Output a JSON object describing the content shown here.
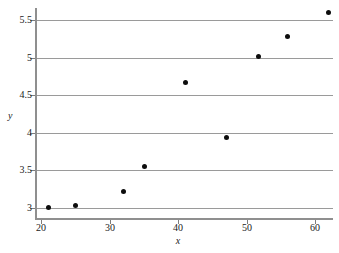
{
  "chart_data": {
    "type": "scatter",
    "title": "",
    "xlabel": "x",
    "ylabel": "y",
    "xlim": [
      19.2,
      62.6
    ],
    "ylim": [
      2.86,
      5.66
    ],
    "grid": true,
    "grid_axis": "y",
    "legend": null,
    "marker": {
      "shape": "circle",
      "color": "#0d0d0d",
      "size": 5
    },
    "xticks": [
      20,
      30,
      40,
      50,
      60
    ],
    "xtick_labels": [
      "20",
      "30",
      "40",
      "50",
      "60"
    ],
    "yticks": [
      3,
      3.5,
      4,
      4.5,
      5,
      5.5
    ],
    "ytick_labels": [
      "3",
      "3.5",
      "4",
      "4.5",
      "5",
      "5.5"
    ],
    "x": [
      21,
      25,
      32,
      35,
      41,
      47,
      51.7,
      56,
      62
    ],
    "y": [
      3.0,
      3.03,
      3.22,
      3.55,
      4.67,
      3.93,
      5.02,
      5.28,
      5.6
    ],
    "points": [
      {
        "x": 21,
        "y": 3.0
      },
      {
        "x": 25,
        "y": 3.03
      },
      {
        "x": 32,
        "y": 3.22
      },
      {
        "x": 35,
        "y": 3.55
      },
      {
        "x": 41,
        "y": 4.67
      },
      {
        "x": 47,
        "y": 3.93
      },
      {
        "x": 51.7,
        "y": 5.02
      },
      {
        "x": 56,
        "y": 5.28
      },
      {
        "x": 62,
        "y": 5.6
      }
    ]
  },
  "colors": {
    "background": "#ffffff",
    "grid": "#9a9a9a",
    "axis": "#8f8f8f",
    "marker": "#0d0d0d",
    "text": "#1a1a1a"
  }
}
